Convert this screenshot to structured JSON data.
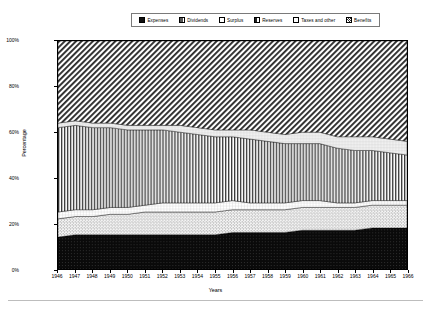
{
  "chart_data": {
    "type": "area",
    "title": "",
    "xlabel": "Years",
    "ylabel": "Percentage",
    "ylim": [
      0,
      100
    ],
    "ytick_labels": [
      "0%",
      "20%",
      "40%",
      "60%",
      "80%",
      "100%"
    ],
    "ytick_values": [
      0,
      20,
      40,
      60,
      80,
      100
    ],
    "grid": false,
    "legend_position": "top",
    "stacked": true,
    "normalized_percent": true,
    "categories": [
      "1946",
      "1947",
      "1948",
      "1949",
      "1950",
      "1951",
      "1952",
      "1953",
      "1954",
      "1955",
      "1956",
      "1957",
      "1958",
      "1959",
      "1960",
      "1961",
      "1962",
      "1963",
      "1964",
      "1965",
      "1966"
    ],
    "series": [
      {
        "name": "Expenses",
        "pattern": "solid-black",
        "values": [
          14,
          15,
          15,
          15,
          15,
          15,
          15,
          15,
          15,
          15,
          16,
          16,
          16,
          16,
          17,
          17,
          17,
          17,
          18,
          18,
          18
        ]
      },
      {
        "name": "Dividends",
        "pattern": "fine-dots",
        "values": [
          8,
          8,
          8,
          9,
          9,
          10,
          10,
          10,
          10,
          10,
          10,
          10,
          10,
          10,
          10,
          10,
          10,
          10,
          10,
          10,
          10
        ]
      },
      {
        "name": "Surplus",
        "pattern": "light-weave",
        "values": [
          3,
          3,
          3,
          3,
          3,
          3,
          4,
          4,
          4,
          4,
          4,
          3,
          3,
          3,
          3,
          3,
          2,
          2,
          2,
          2,
          2
        ]
      },
      {
        "name": "Reserves",
        "pattern": "vertical-stripes",
        "values": [
          37,
          37,
          36,
          35,
          34,
          33,
          32,
          31,
          30,
          29,
          28,
          28,
          27,
          26,
          25,
          25,
          24,
          23,
          22,
          21,
          20
        ]
      },
      {
        "name": "Taxes and other",
        "pattern": "coarse-weave",
        "values": [
          2,
          2,
          2,
          2,
          2,
          2,
          2,
          3,
          3,
          3,
          3,
          4,
          4,
          4,
          5,
          5,
          5,
          6,
          6,
          6,
          6
        ]
      },
      {
        "name": "Benefits",
        "pattern": "diagonal-hatch",
        "values": [
          36,
          35,
          36,
          36,
          37,
          37,
          37,
          37,
          38,
          39,
          39,
          39,
          40,
          41,
          40,
          40,
          42,
          42,
          42,
          43,
          44
        ]
      }
    ]
  }
}
